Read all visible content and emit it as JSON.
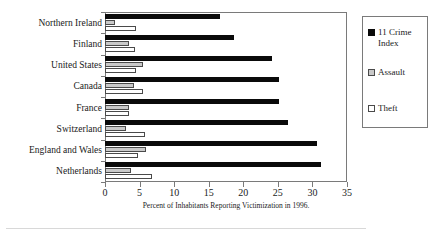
{
  "chart_data": {
    "type": "bar",
    "orientation": "horizontal",
    "title": "",
    "xlabel": "Percent of Inhabitants Reporting Victimization in 1996.",
    "ylabel": "",
    "xlim": [
      0,
      35
    ],
    "xticks": [
      0,
      5,
      10,
      15,
      20,
      25,
      30,
      35
    ],
    "grid": false,
    "legend_position": "right",
    "categories": [
      "Northern Ireland",
      "Finland",
      "United States",
      "Canada",
      "France",
      "Switzerland",
      "England and Wales",
      "Netherlands"
    ],
    "series": [
      {
        "name": "11 Crime Index",
        "color": "#0a0a0a",
        "values": [
          16.7,
          18.7,
          24.2,
          25.1,
          25.1,
          26.5,
          30.7,
          31.2
        ]
      },
      {
        "name": "Assault",
        "color": "#c9c9c9",
        "values": [
          1.5,
          3.5,
          5.5,
          4.2,
          3.4,
          3.0,
          6.0,
          3.8
        ]
      },
      {
        "name": "Theft",
        "color": "#ffffff",
        "values": [
          4.5,
          4.3,
          4.5,
          5.5,
          3.5,
          5.8,
          4.8,
          6.8
        ]
      }
    ]
  },
  "legend": {
    "items": [
      {
        "label": "11 Crime Index",
        "swatch": "black-square-icon"
      },
      {
        "label": "Assault",
        "swatch": "gray-square-icon"
      },
      {
        "label": "Theft",
        "swatch": "white-square-icon"
      }
    ]
  }
}
